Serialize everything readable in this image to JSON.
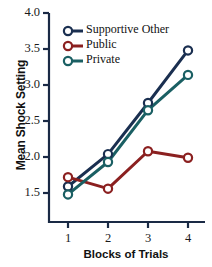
{
  "chart_data": {
    "type": "line",
    "title": "",
    "xlabel": "Blocks of Trials",
    "ylabel": "Mean Shock Setting",
    "categories": [
      "1",
      "2",
      "3",
      "4"
    ],
    "x": [
      1,
      2,
      3,
      4
    ],
    "xlim": [
      0.7,
      4.3
    ],
    "ylim": [
      1.3,
      4.0
    ],
    "yticks": [
      "1.5",
      "2.0",
      "2.5",
      "3.0",
      "3.5",
      "4.0"
    ],
    "ytick_values": [
      1.5,
      2.0,
      2.5,
      3.0,
      3.5,
      4.0
    ],
    "grid": false,
    "legend_position": "upper-left-inside",
    "series": [
      {
        "name": "Supportive Other",
        "color": "#1a2f50",
        "values": [
          1.59,
          2.04,
          2.75,
          3.48
        ]
      },
      {
        "name": "Public",
        "color": "#8b2020",
        "values": [
          1.72,
          1.56,
          2.08,
          1.99
        ]
      },
      {
        "name": "Private",
        "color": "#1a5f63",
        "values": [
          1.48,
          1.93,
          2.65,
          3.14
        ]
      }
    ]
  },
  "axis": {
    "color": "#1a2a45"
  }
}
